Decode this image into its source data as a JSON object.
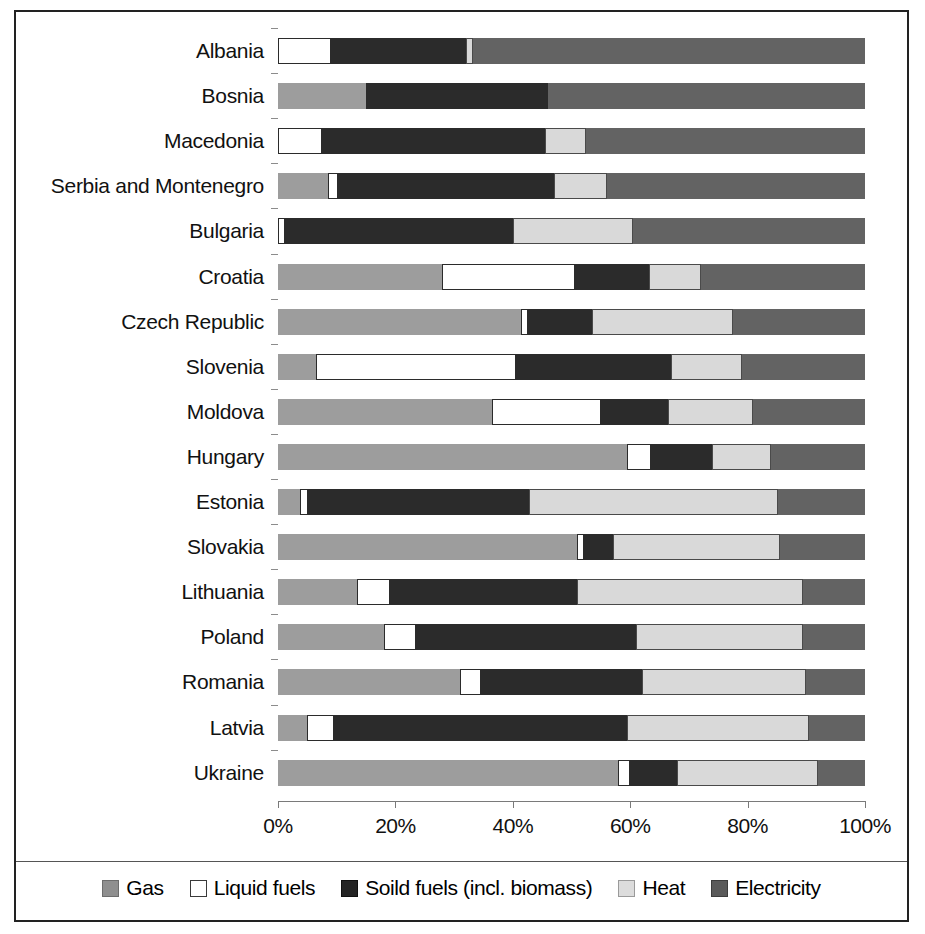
{
  "chart_data": {
    "type": "bar",
    "orientation": "horizontal",
    "stacked": true,
    "normalized": true,
    "title": "",
    "xlabel": "",
    "ylabel": "",
    "xlim": [
      0,
      100
    ],
    "grid": false,
    "legend_position": "bottom",
    "tick_labels": [
      "0%",
      "20%",
      "40%",
      "60%",
      "80%",
      "100%"
    ],
    "tick_values": [
      0,
      20,
      40,
      60,
      80,
      100
    ],
    "series": [
      {
        "name": "Gas",
        "color": "#9d9d9d"
      },
      {
        "name": "Liquid fuels",
        "color": "#ffffff"
      },
      {
        "name": "Soild fuels (incl. biomass)",
        "color": "#2b2b2b"
      },
      {
        "name": "Heat",
        "color": "#d9d9d9"
      },
      {
        "name": "Electricity",
        "color": "#636363"
      }
    ],
    "categories": [
      "Albania",
      "Bosnia",
      "Macedonia",
      "Serbia and Montenegro",
      "Bulgaria",
      "Croatia",
      "Czech Republic",
      "Slovenia",
      "Moldova",
      "Hungary",
      "Estonia",
      "Slovakia",
      "Lithuania",
      "Poland",
      "Romania",
      "Latvia",
      "Ukraine"
    ],
    "rows": [
      {
        "category": "Albania",
        "gas": 0.0,
        "liquid": 9.0,
        "solid": 23.0,
        "heat": 1.3,
        "electricity": 66.7
      },
      {
        "category": "Bosnia",
        "gas": 15.0,
        "liquid": 0.0,
        "solid": 31.0,
        "heat": 0.0,
        "electricity": 54.0
      },
      {
        "category": "Macedonia",
        "gas": 0.0,
        "liquid": 7.5,
        "solid": 38.0,
        "heat": 7.0,
        "electricity": 47.5
      },
      {
        "category": "Serbia and Montenegro",
        "gas": 8.5,
        "liquid": 1.8,
        "solid": 36.7,
        "heat": 9.0,
        "electricity": 44.0
      },
      {
        "category": "Bulgaria",
        "gas": 0.0,
        "liquid": 1.2,
        "solid": 38.8,
        "heat": 20.5,
        "electricity": 39.5
      },
      {
        "category": "Croatia",
        "gas": 28.0,
        "liquid": 22.6,
        "solid": 12.6,
        "heat": 8.8,
        "electricity": 28.0
      },
      {
        "category": "Czech Republic",
        "gas": 41.4,
        "liquid": 1.2,
        "solid": 10.9,
        "heat": 24.0,
        "electricity": 22.5
      },
      {
        "category": "Slovenia",
        "gas": 6.5,
        "liquid": 34.0,
        "solid": 26.5,
        "heat": 12.0,
        "electricity": 21.0
      },
      {
        "category": "Moldova",
        "gas": 36.5,
        "liquid": 18.5,
        "solid": 11.5,
        "heat": 14.5,
        "electricity": 19.0
      },
      {
        "category": "Hungary",
        "gas": 59.5,
        "liquid": 4.0,
        "solid": 10.5,
        "heat": 10.0,
        "electricity": 16.0
      },
      {
        "category": "Estonia",
        "gas": 3.7,
        "liquid": 1.4,
        "solid": 37.7,
        "heat": 42.4,
        "electricity": 14.8
      },
      {
        "category": "Slovakia",
        "gas": 51.0,
        "liquid": 1.2,
        "solid": 4.8,
        "heat": 28.5,
        "electricity": 14.5
      },
      {
        "category": "Lithuania",
        "gas": 13.5,
        "liquid": 5.5,
        "solid": 32.0,
        "heat": 38.5,
        "electricity": 10.5
      },
      {
        "category": "Poland",
        "gas": 18.0,
        "liquid": 5.5,
        "solid": 37.5,
        "heat": 28.5,
        "electricity": 10.5
      },
      {
        "category": "Romania",
        "gas": 31.0,
        "liquid": 3.5,
        "solid": 27.5,
        "heat": 28.0,
        "electricity": 10.0
      },
      {
        "category": "Latvia",
        "gas": 5.0,
        "liquid": 4.5,
        "solid": 50.0,
        "heat": 31.0,
        "electricity": 9.5
      },
      {
        "category": "Ukraine",
        "gas": 58.0,
        "liquid": 2.0,
        "solid": 8.0,
        "heat": 24.0,
        "electricity": 8.0
      }
    ]
  },
  "legend": {
    "items": [
      {
        "label": "Gas",
        "swatch": "gas-swatch"
      },
      {
        "label": "Liquid fuels",
        "swatch": "liquid-fuels-swatch"
      },
      {
        "label": "Soild fuels (incl. biomass)",
        "swatch": "solid-fuels-swatch"
      },
      {
        "label": "Heat",
        "swatch": "heat-swatch"
      },
      {
        "label": "Electricity",
        "swatch": "electricity-swatch"
      }
    ]
  }
}
